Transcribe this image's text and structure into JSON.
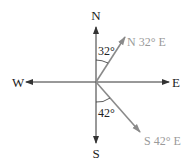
{
  "diagram": {
    "type": "compass-bearings",
    "cardinals": {
      "north": "N",
      "south": "S",
      "east": "E",
      "west": "W"
    },
    "bearings": [
      {
        "label": "N 32° E",
        "angle_label": "32°",
        "reference": "N",
        "angle_deg": 32,
        "color": "#8a8a8a"
      },
      {
        "label": "S 42° E",
        "angle_label": "42°",
        "reference": "S",
        "angle_deg": 42,
        "color": "#8a8a8a"
      }
    ],
    "colors": {
      "axes": "#333333",
      "bearing_arrows": "#8a8a8a",
      "bearing_labels": "#9a9a9a"
    }
  }
}
